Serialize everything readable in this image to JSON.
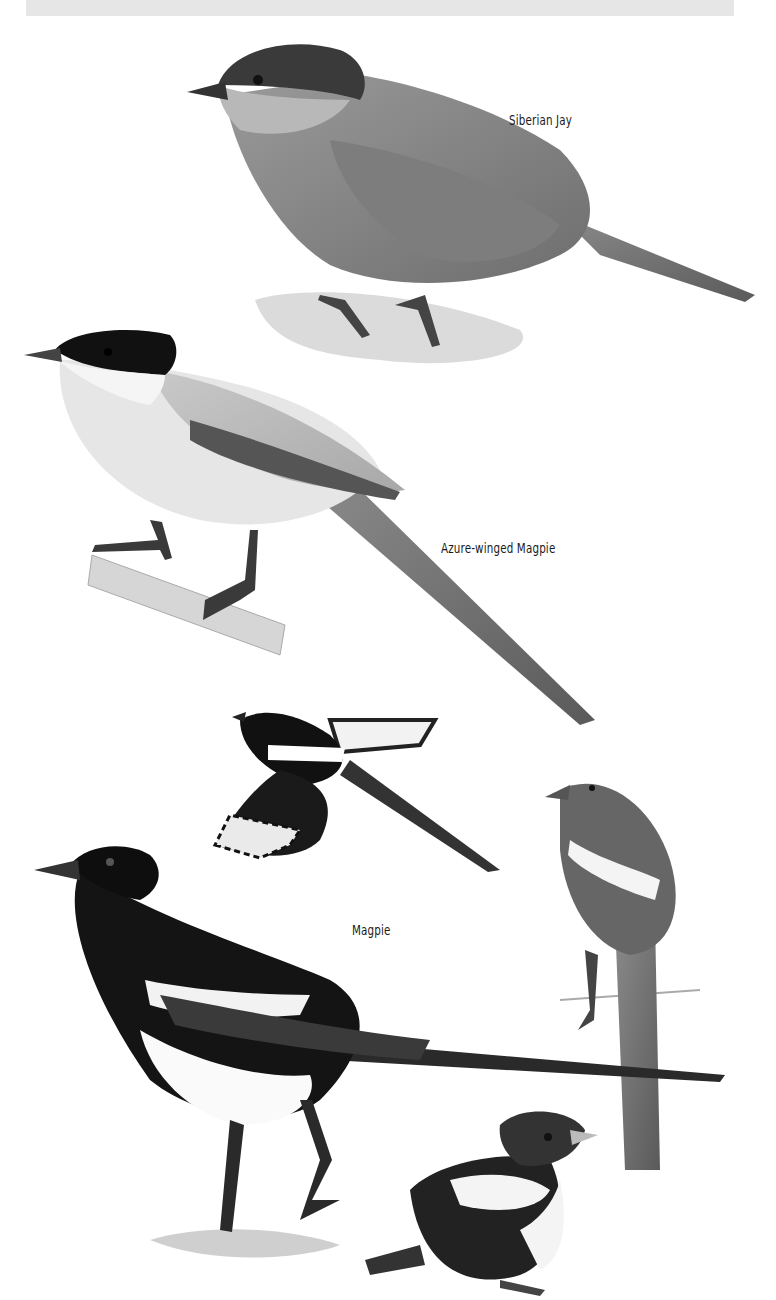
{
  "plate": {
    "background": "#ffffff",
    "top_strip_color": "#e6e6e6",
    "species": [
      {
        "id": "siberian-jay",
        "label": "Siberian Jay"
      },
      {
        "id": "azure-winged-magpie",
        "label": "Azure-winged Magpie"
      },
      {
        "id": "magpie",
        "label": "Magpie"
      }
    ],
    "illustrations": [
      {
        "species": "Siberian Jay",
        "pose": "perched on lichen"
      },
      {
        "species": "Azure-winged Magpie",
        "pose": "perched on branch"
      },
      {
        "species": "Magpie",
        "pose": "in flight"
      },
      {
        "species": "Magpie",
        "pose": "perched, rear view"
      },
      {
        "species": "Magpie",
        "pose": "standing adult"
      },
      {
        "species": "Magpie",
        "pose": "juvenile"
      }
    ]
  }
}
